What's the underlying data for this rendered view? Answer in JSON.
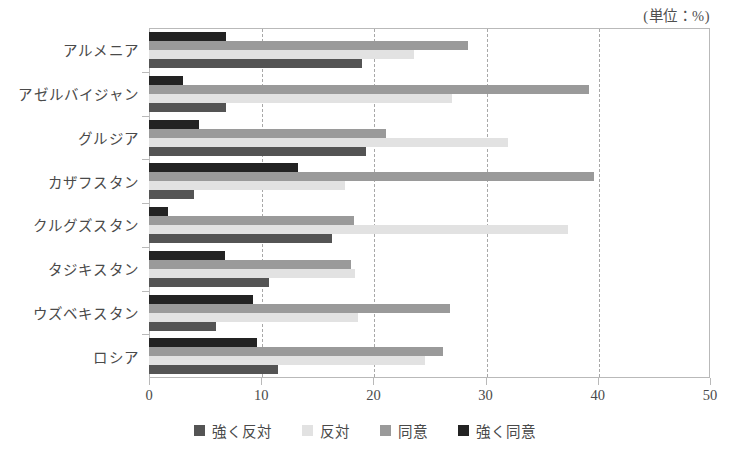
{
  "caption": "(単位：%)",
  "chart_data": {
    "type": "bar",
    "orientation": "horizontal",
    "title": "",
    "subtitle": "",
    "unit_note": "(単位：%)",
    "xlabel": "",
    "ylabel": "",
    "xlim": [
      0,
      50
    ],
    "xticks": [
      0,
      10,
      20,
      30,
      40,
      50
    ],
    "xtick_labels": [
      "0",
      "10",
      "20",
      "30",
      "40",
      "50"
    ],
    "grid": "vertical-dashed",
    "legend_position": "bottom-center",
    "categories": [
      "アルメニア",
      "アゼルバイジャン",
      "グルジア",
      "カザフスタン",
      "クルグズスタン",
      "タジキスタン",
      "ウズベキスタン",
      "ロシア"
    ],
    "series": [
      {
        "name": "強く反対",
        "color": "#545454",
        "values": [
          19.0,
          6.9,
          19.3,
          4.0,
          16.3,
          10.7,
          6.0,
          11.5
        ]
      },
      {
        "name": "反対",
        "color": "#e2e2e2",
        "values": [
          23.6,
          27.0,
          32.0,
          17.5,
          37.3,
          18.4,
          18.6,
          24.6
        ]
      },
      {
        "name": "同意",
        "color": "#9a9a9a",
        "values": [
          28.4,
          39.2,
          21.1,
          39.7,
          18.3,
          18.0,
          26.8,
          26.2
        ]
      },
      {
        "name": "強く同意",
        "color": "#232323",
        "values": [
          6.9,
          3.0,
          4.5,
          13.3,
          1.7,
          6.8,
          9.3,
          9.6
        ]
      }
    ]
  },
  "legend": {
    "items": [
      {
        "label": "強く反対",
        "color": "#545454"
      },
      {
        "label": "反対",
        "color": "#e2e2e2"
      },
      {
        "label": "同意",
        "color": "#9a9a9a"
      },
      {
        "label": "強く同意",
        "color": "#232323"
      }
    ]
  }
}
